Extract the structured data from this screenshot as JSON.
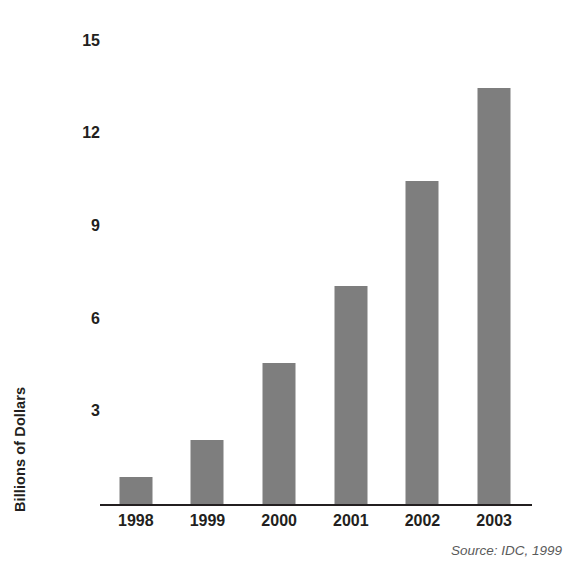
{
  "chart_data": {
    "type": "bar",
    "title": "",
    "subtitle": "",
    "xlabel": "",
    "ylabel": "Billions of Dollars",
    "categories": [
      "1998",
      "1999",
      "2000",
      "2001",
      "2002",
      "2003"
    ],
    "values": [
      0.9,
      2.1,
      4.6,
      7.1,
      10.5,
      13.5
    ],
    "series": [
      {
        "name": "",
        "values": [
          0.9,
          2.1,
          4.6,
          7.1,
          10.5,
          13.5
        ]
      }
    ],
    "ylim": [
      0,
      15
    ],
    "yticks": [
      3,
      6,
      9,
      12,
      15
    ],
    "ytick_labels": [
      "3",
      "6",
      "9",
      "12",
      "15"
    ],
    "grid": false,
    "legend": false,
    "legend_position": "none",
    "annotations": [
      "Source: IDC, 1999"
    ],
    "bar_color": "#7e7e7e",
    "axis_color": "#231f20",
    "text_color": "#231f20",
    "background": "#ffffff"
  },
  "figure": {
    "y_axis_title": "Billions of Dollars",
    "source_note": "Source: IDC, 1999"
  }
}
